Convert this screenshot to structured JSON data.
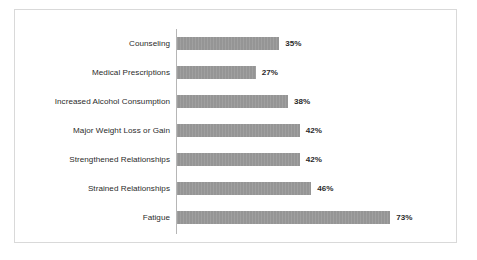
{
  "chart_data": {
    "type": "bar",
    "orientation": "horizontal",
    "title": "",
    "subtitle": "",
    "xlabel": "",
    "ylabel": "",
    "grid": false,
    "legend": false,
    "legend_position": "none",
    "axis_line": "vertical-category-axis",
    "value_suffix": "%",
    "xlim": [
      0,
      73
    ],
    "categories": [
      "Counseling",
      "Medical Prescriptions",
      "Increased Alcohol Consumption",
      "Major Weight Loss or Gain",
      "Strengthened Relationships",
      "Strained Relationships",
      "Fatigue"
    ],
    "values": [
      35,
      27,
      38,
      42,
      42,
      46,
      73
    ],
    "data_labels": [
      "35%",
      "27%",
      "38%",
      "42%",
      "42%",
      "46%",
      "73%"
    ],
    "colors": {
      "bar": "#959595",
      "axis": "#b6b6b6",
      "border": "#d9d9d9",
      "text": "#2b2b2b",
      "background": "#ffffff"
    }
  }
}
